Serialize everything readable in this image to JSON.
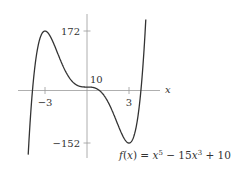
{
  "chart_data": {
    "type": "line",
    "title": "",
    "function_label": "f(x) = x^5 − 15x^3 + 10",
    "function_label_parts": {
      "f": "f",
      "open": "(",
      "x1": "x",
      "close": ") = ",
      "x2": "x",
      "exp1": "5",
      "mid": " − 15",
      "x3": "x",
      "exp2": "3",
      "tail": " + 10"
    },
    "xlabel": "x",
    "ylabel": "",
    "x_ticks": [
      {
        "value": -3,
        "label": "−3"
      },
      {
        "value": 3,
        "label": "3"
      }
    ],
    "y_ticks": [
      {
        "value": 172,
        "label": "172"
      },
      {
        "value": 10,
        "label": "10"
      },
      {
        "value": -152,
        "label": "−152"
      }
    ],
    "xlim": [
      -4.2,
      4.2
    ],
    "ylim": [
      -200,
      220
    ],
    "grid": false,
    "series": [
      {
        "name": "f(x) = x^5 - 15x^3 + 10",
        "x": [
          -4.2,
          -4.0,
          -3.5,
          -3.0,
          -2.5,
          -2.0,
          -1.5,
          -1.0,
          -0.5,
          0,
          0.5,
          1.0,
          1.5,
          2.0,
          2.5,
          3.0,
          3.5,
          4.0,
          4.2
        ],
        "values": [
          -185.6,
          -54,
          130.3,
          172,
          146.9,
          98,
          45.0,
          24,
          11.8,
          10,
          8.2,
          -4,
          -25.0,
          -78,
          -126.9,
          -152,
          -110.3,
          74,
          205.6
        ]
      }
    ],
    "annotations": [
      {
        "text": "172",
        "at": [
          0,
          172
        ],
        "note": "local max at x=-3"
      },
      {
        "text": "10",
        "at": [
          0,
          10
        ],
        "note": "y-intercept"
      },
      {
        "text": "−152",
        "at": [
          0,
          -152
        ],
        "note": "local min at x=3"
      }
    ],
    "colors": {
      "curve": "#333333",
      "axes": "#999999",
      "text": "#333333"
    }
  }
}
